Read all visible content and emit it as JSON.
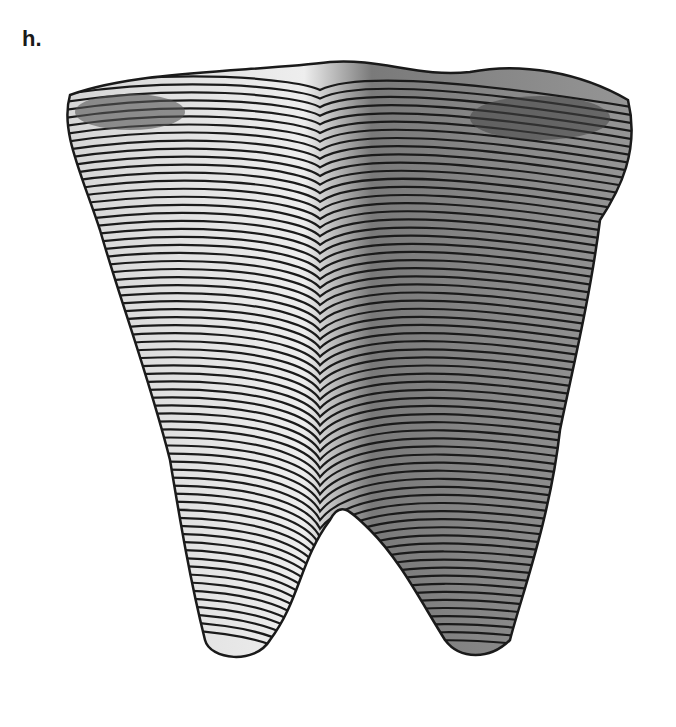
{
  "figure": {
    "panel_label": "h.",
    "colors": {
      "ink": "#1a1a1a",
      "paper": "#ffffff",
      "shade": "#8a8a8a"
    }
  }
}
